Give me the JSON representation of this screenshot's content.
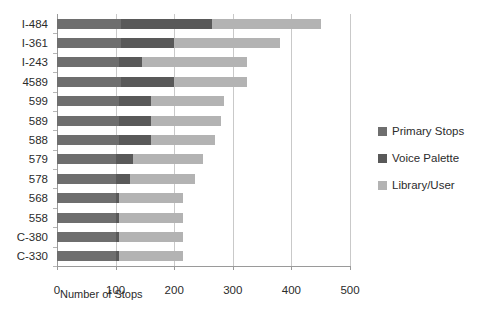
{
  "chart_data": {
    "type": "bar",
    "orientation": "horizontal",
    "stacked": true,
    "title": "",
    "xlabel": "Number of Stops",
    "ylabel": "",
    "xlim": [
      0,
      500
    ],
    "xticks": [
      0,
      100,
      200,
      300,
      400,
      500
    ],
    "xtick_labels": [
      "0",
      "100",
      "200",
      "300",
      "400",
      "500"
    ],
    "grid": true,
    "grid_axis": "x",
    "legend_position": "right",
    "categories": [
      "I-484",
      "I-361",
      "I-243",
      "4589",
      "599",
      "589",
      "588",
      "579",
      "578",
      "568",
      "558",
      "C-380",
      "C-330"
    ],
    "series": [
      {
        "name": "Primary Stops",
        "color": "#6e6e6e",
        "values": [
          110,
          110,
          105,
          110,
          105,
          105,
          105,
          100,
          100,
          100,
          100,
          100,
          100
        ]
      },
      {
        "name": "Voice Palette",
        "color": "#595959",
        "values": [
          155,
          90,
          40,
          90,
          55,
          55,
          55,
          30,
          25,
          5,
          5,
          5,
          5
        ]
      },
      {
        "name": "Library/User",
        "color": "#b3b3b3",
        "values": [
          185,
          180,
          180,
          125,
          125,
          120,
          110,
          120,
          110,
          110,
          110,
          110,
          110
        ]
      }
    ],
    "totals": [
      450,
      380,
      325,
      325,
      285,
      280,
      270,
      250,
      235,
      215,
      215,
      215,
      215
    ]
  },
  "legend": {
    "items": [
      {
        "label": "Primary Stops",
        "color": "#6e6e6e"
      },
      {
        "label": "Voice Palette",
        "color": "#595959"
      },
      {
        "label": "Library/User",
        "color": "#b3b3b3"
      }
    ]
  }
}
